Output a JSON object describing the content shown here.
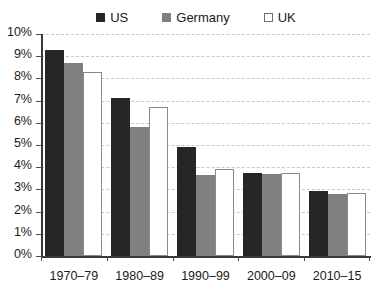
{
  "chart_data": {
    "type": "bar",
    "title": "",
    "subtitle": "",
    "xlabel": "",
    "ylabel": "",
    "categories": [
      "1970–79",
      "1980–89",
      "1990–99",
      "2000–09",
      "2010–15"
    ],
    "series": [
      {
        "name": "US",
        "color": "#262626",
        "values": [
          9.3,
          7.1,
          4.9,
          3.75,
          2.95
        ]
      },
      {
        "name": "Germany",
        "color": "#808080",
        "values": [
          8.7,
          5.8,
          3.65,
          3.7,
          2.8
        ]
      },
      {
        "name": "UK",
        "color": "#ffffff",
        "values": [
          8.3,
          6.7,
          3.9,
          3.75,
          2.85
        ]
      }
    ],
    "ylim": [
      0,
      10
    ],
    "ytick_step": 1,
    "ytick_labels": [
      "0%",
      "1%",
      "2%",
      "3%",
      "4%",
      "5%",
      "6%",
      "7%",
      "8%",
      "9%",
      "10%"
    ],
    "value_suffix": "%",
    "grid": {
      "horizontal": true,
      "vertical": false,
      "style": "dashed",
      "color": "#c8c8c8"
    },
    "legend": {
      "position": "top",
      "entries": [
        "US",
        "Germany",
        "UK"
      ]
    },
    "annotations": []
  }
}
